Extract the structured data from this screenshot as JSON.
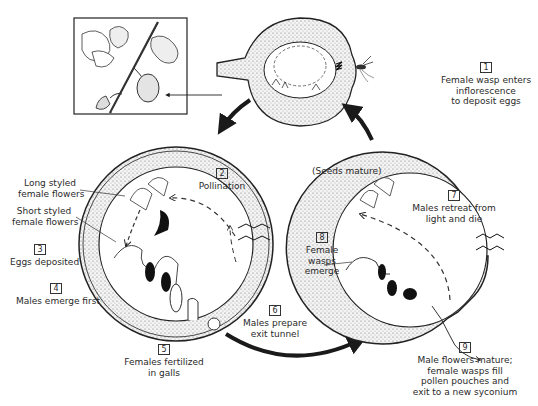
{
  "diagram": {
    "inset": {
      "label": "Fig branch with syconia"
    },
    "steps": [
      {
        "number": "1",
        "lines": [
          "Female wasp enters",
          "inflorescence",
          "to deposit eggs"
        ]
      },
      {
        "number": "2",
        "lines": [
          "Pollination"
        ]
      },
      {
        "number": "3",
        "lines": [
          "Eggs deposited"
        ]
      },
      {
        "number": "4",
        "lines": [
          "Males emerge first"
        ]
      },
      {
        "number": "5",
        "lines": [
          "Females fertilized",
          "in galls"
        ]
      },
      {
        "number": "6",
        "lines": [
          "Males prepare",
          "exit tunnel"
        ]
      },
      {
        "number": "7",
        "lines": [
          "Males retreat from",
          "light and die"
        ]
      },
      {
        "number": "8",
        "lines": [
          "Female",
          "wasps",
          "emerge"
        ]
      },
      {
        "number": "9",
        "lines": [
          "Male flowers mature;",
          "female wasps fill",
          "pollen pouches and",
          "exit to a new syconium"
        ]
      }
    ],
    "annotations": {
      "long_styled": [
        "Long styled",
        "female flowers"
      ],
      "short_styled": [
        "Short styled",
        "female flowers"
      ],
      "seeds_mature": "(Seeds mature)"
    },
    "colors": {
      "ink": "#1a1a1a",
      "stipple": "#e8e8e8",
      "background": "#ffffff"
    }
  }
}
